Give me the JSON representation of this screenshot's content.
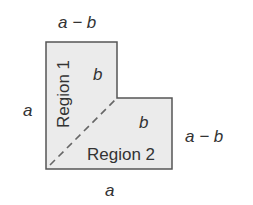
{
  "diagram": {
    "labels": {
      "top": "a − b",
      "left": "a",
      "right": "a − b",
      "bottom": "a",
      "inner_top": "b",
      "inner_right": "b",
      "region1": "Region 1",
      "region2": "Region 2"
    },
    "colors": {
      "fill": "#ebebeb",
      "stroke": "#555555",
      "dash": "#666666"
    }
  }
}
